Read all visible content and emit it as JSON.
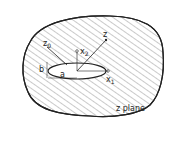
{
  "diagram": {
    "region_label": "z plane",
    "labels": {
      "z0": "z",
      "z0_sub": "0",
      "z": "z",
      "x2": "x",
      "x2_sub": "2",
      "x1": "x",
      "x1_sub": "1",
      "a": "a",
      "b": "b"
    },
    "colors": {
      "stroke": "#222222",
      "hatch": "#555555",
      "background": "#ffffff"
    }
  }
}
